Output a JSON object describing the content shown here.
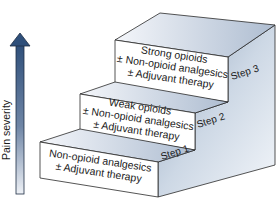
{
  "diagram": {
    "type": "staircase",
    "axis": {
      "label": "Pain severity",
      "direction": "up",
      "color": "#2f4f7a"
    },
    "steps": [
      {
        "label": "Step 1",
        "lines": [
          "Non-opioid analgesics",
          "± Adjuvant therapy"
        ]
      },
      {
        "label": "Step 2",
        "lines": [
          "Weak opioids",
          "± Non-opioid analgesics",
          "± Adjuvant therapy"
        ]
      },
      {
        "label": "Step 3",
        "lines": [
          "Strong opioids",
          "± Non-opioid analgesics",
          "± Adjuvant therapy"
        ]
      }
    ],
    "colors": {
      "front_face": "#ffffff",
      "side_face_light": "#e4ebf3",
      "side_face_dark": "#9fb0c6",
      "top_face_light": "#f2f5f9",
      "top_face_dark": "#b6c4d6",
      "outline": "#2a2a2a"
    }
  }
}
